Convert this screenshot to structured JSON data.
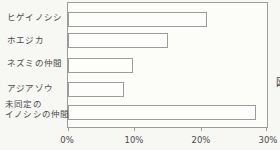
{
  "page": {
    "background": "#f7f7f4",
    "partial_right_text": "図"
  },
  "chart_data": {
    "type": "bar",
    "orientation": "horizontal",
    "title": "",
    "xlabel": "",
    "ylabel": "",
    "xlim": [
      0,
      30
    ],
    "x_tick_labels": [
      "0%",
      "10%",
      "20%",
      "30%"
    ],
    "grid": false,
    "legend": false,
    "bar_fill": "#fdfdfc",
    "bar_outline": "#9c9c9c",
    "unit": "%",
    "categories": [
      "ヒゲイノシシ",
      "ホエジカ",
      "ネズミの仲間",
      "アジアゾウ",
      "未同定のイノシシの仲間"
    ],
    "category_label_lines": [
      [
        "ヒゲイノシシ"
      ],
      [
        "ホエジカ"
      ],
      [
        "ネズミの仲間"
      ],
      [
        "アジアゾウ"
      ],
      [
        "未同定の",
        "イノシシの仲間"
      ]
    ],
    "values": [
      21,
      15,
      9.8,
      8.5,
      28.4
    ]
  }
}
